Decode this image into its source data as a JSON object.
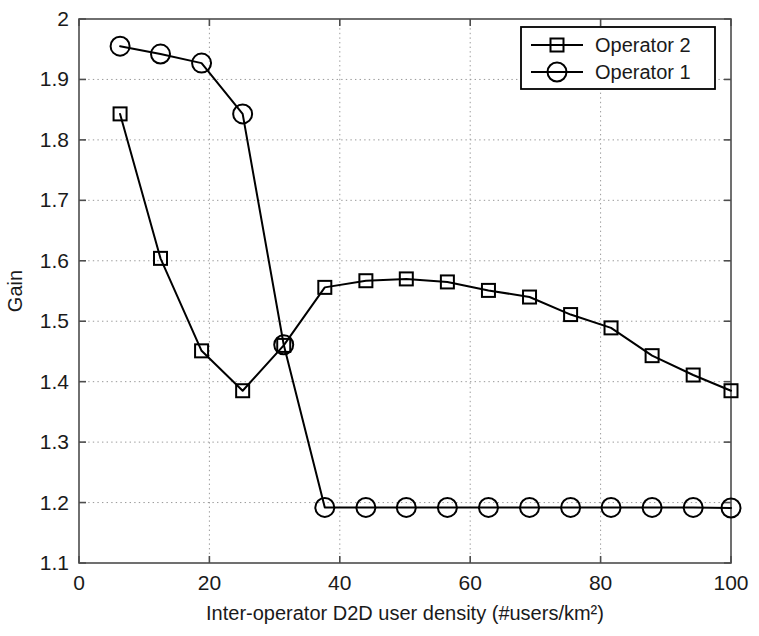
{
  "chart_data": {
    "type": "line",
    "title": "",
    "xlabel": "Inter-operator D2D user density (#users/km²)",
    "ylabel": "Gain",
    "xlim": [
      0,
      100
    ],
    "ylim": [
      1.1,
      2.0
    ],
    "xticks": [
      0,
      20,
      40,
      60,
      80,
      100
    ],
    "yticks": [
      1.1,
      1.2,
      1.3,
      1.4,
      1.5,
      1.6,
      1.7,
      1.8,
      1.9,
      2
    ],
    "xtick_labels": [
      "0",
      "20",
      "40",
      "60",
      "80",
      "100"
    ],
    "ytick_labels": [
      "1.1",
      "1.2",
      "1.3",
      "1.4",
      "1.5",
      "1.6",
      "1.7",
      "1.8",
      "1.9",
      "2"
    ],
    "grid": true,
    "legend_position": "top-right",
    "x": [
      6.3,
      12.5,
      18.8,
      25.1,
      31.4,
      37.7,
      44.0,
      50.2,
      56.5,
      62.8,
      69.1,
      75.4,
      81.6,
      87.9,
      94.2,
      100.0
    ],
    "series": [
      {
        "name": "Operator 2",
        "marker": "square",
        "values": [
          1.843,
          1.604,
          1.451,
          1.385,
          1.46,
          1.556,
          1.567,
          1.57,
          1.565,
          1.551,
          1.54,
          1.511,
          1.489,
          1.443,
          1.411,
          1.385
        ]
      },
      {
        "name": "Operator 1",
        "marker": "circle",
        "values": [
          1.955,
          1.942,
          1.927,
          1.843,
          1.461,
          1.192,
          1.192,
          1.192,
          1.192,
          1.192,
          1.192,
          1.192,
          1.192,
          1.192,
          1.192,
          1.191
        ]
      }
    ],
    "legend": [
      {
        "label": "Operator 2",
        "marker": "square"
      },
      {
        "label": "Operator 1",
        "marker": "circle"
      }
    ],
    "colors": {
      "series": "#000000",
      "axis": "#4d4d4d",
      "grid": "#9a9a9a",
      "background": "#ffffff"
    }
  }
}
